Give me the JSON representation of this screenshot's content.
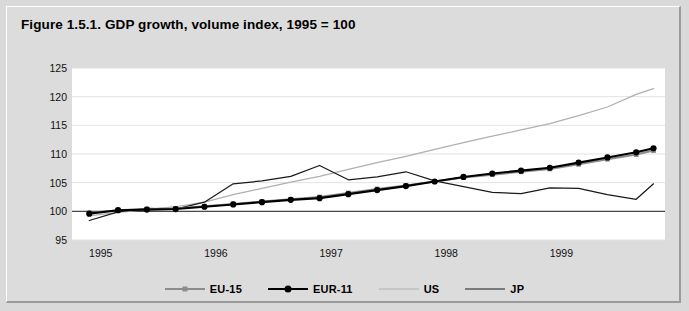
{
  "figure": {
    "title": "Figure 1.5.1. GDP growth, volume index, 1995 = 100"
  },
  "colors": {
    "panel_bg": "#dcdcdc",
    "plot_bg": "#ffffff",
    "grid": "#e2e2e2",
    "eu15": "#8c8c8c",
    "eur11": "#000000",
    "us": "#b0b0b0",
    "jp": "#1a1a1a",
    "baseline": "#4a4a4a"
  },
  "legend": {
    "position": "bottom-center",
    "items": [
      {
        "label": "EU-15",
        "marker": "square",
        "color": "#8c8c8c"
      },
      {
        "label": "EUR-11",
        "marker": "circle",
        "color": "#000000"
      },
      {
        "label": "US",
        "marker": "none",
        "color": "#b0b0b0"
      },
      {
        "label": "JP",
        "marker": "none",
        "color": "#1a1a1a"
      }
    ]
  },
  "chart_data": {
    "type": "line",
    "title": "Figure 1.5.1. GDP growth, volume index, 1995 = 100",
    "xlabel": "",
    "ylabel": "",
    "ylim": [
      95,
      125
    ],
    "yticks": [
      95,
      100,
      105,
      110,
      115,
      120,
      125
    ],
    "ytick_labels": [
      "95",
      "100",
      "105",
      "110",
      "115",
      "120",
      "125"
    ],
    "xlim": [
      1994.75,
      1999.9
    ],
    "xticks": [
      1995,
      1996,
      1997,
      1998,
      1999
    ],
    "xtick_labels": [
      "1995",
      "1996",
      "1997",
      "1998",
      "1999"
    ],
    "grid": true,
    "baseline": 100,
    "x": [
      1994.9,
      1995.15,
      1995.4,
      1995.65,
      1995.9,
      1996.15,
      1996.4,
      1996.65,
      1996.9,
      1997.15,
      1997.4,
      1997.65,
      1997.9,
      1998.15,
      1998.4,
      1998.65,
      1998.9,
      1999.15,
      1999.4,
      1999.65,
      1999.8
    ],
    "series": [
      {
        "name": "EU-15",
        "color": "#8c8c8c",
        "marker": "square",
        "values": [
          99.7,
          100.2,
          100.4,
          100.5,
          100.9,
          101.3,
          101.7,
          102.1,
          102.5,
          103.2,
          103.9,
          104.5,
          105.2,
          105.9,
          106.4,
          106.9,
          107.4,
          108.2,
          109.1,
          109.9,
          110.6
        ]
      },
      {
        "name": "EUR-11",
        "color": "#000000",
        "marker": "circle",
        "values": [
          99.6,
          100.2,
          100.3,
          100.4,
          100.8,
          101.2,
          101.6,
          102.0,
          102.3,
          103.0,
          103.7,
          104.4,
          105.2,
          106.0,
          106.6,
          107.1,
          107.6,
          108.5,
          109.4,
          110.3,
          111.0
        ]
      },
      {
        "name": "US",
        "color": "#b0b0b0",
        "marker": "none",
        "values": [
          99.2,
          99.8,
          100.3,
          100.8,
          101.6,
          102.9,
          104.0,
          105.1,
          106.1,
          107.3,
          108.5,
          109.6,
          110.8,
          112.0,
          113.1,
          114.2,
          115.3,
          116.7,
          118.2,
          120.4,
          121.4
        ]
      },
      {
        "name": "JP",
        "color": "#1a1a1a",
        "marker": "none",
        "values": [
          98.4,
          99.9,
          100.5,
          100.4,
          101.6,
          104.8,
          105.3,
          106.1,
          108.0,
          105.5,
          106.0,
          106.9,
          105.3,
          104.3,
          103.3,
          103.1,
          104.1,
          104.0,
          102.9,
          102.1,
          104.8
        ]
      }
    ]
  }
}
